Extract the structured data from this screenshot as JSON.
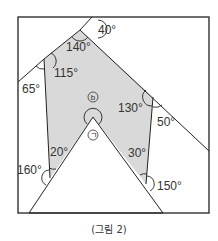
{
  "figure": {
    "caption": "(그림 2)",
    "fill_color": "#d9d9d9",
    "line_color": "#222222",
    "rectangle": {
      "x": 18,
      "y": 17,
      "width": 191,
      "height": 196
    },
    "angles": [
      {
        "id": "a40",
        "label": "40°",
        "x": 98,
        "y": 34
      },
      {
        "id": "a140",
        "label": "140°",
        "x": 66,
        "y": 51
      },
      {
        "id": "a115",
        "label": "115°",
        "x": 54,
        "y": 77
      },
      {
        "id": "a65",
        "label": "65°",
        "x": 22,
        "y": 93
      },
      {
        "id": "a130",
        "label": "130°",
        "x": 118,
        "y": 112
      },
      {
        "id": "a50",
        "label": "50°",
        "x": 157,
        "y": 126
      },
      {
        "id": "a20",
        "label": "20°",
        "x": 50,
        "y": 156
      },
      {
        "id": "a30",
        "label": "30°",
        "x": 128,
        "y": 157
      },
      {
        "id": "a160",
        "label": "160°",
        "x": 17,
        "y": 174
      },
      {
        "id": "a150",
        "label": "150°",
        "x": 157,
        "y": 190
      }
    ],
    "markers": [
      {
        "id": "b",
        "label": "b",
        "x": 93,
        "y": 97
      },
      {
        "id": "giyeok",
        "label": "ㄱ",
        "x": 93,
        "y": 135
      }
    ]
  }
}
